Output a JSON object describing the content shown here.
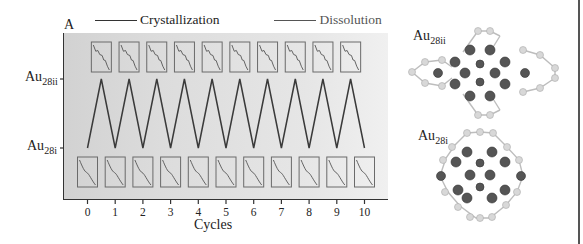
{
  "figure": {
    "panel_label": "A",
    "legend": [
      {
        "label": "Crystallization",
        "color": "#333333"
      },
      {
        "label": "Dissolution",
        "color": "#555555"
      }
    ],
    "y_labels": {
      "top": {
        "base": "Au",
        "sub": "28ii"
      },
      "bottom": {
        "base": "Au",
        "sub": "28i"
      }
    },
    "x_axis_title": "Cycles",
    "x_ticks": [
      "0",
      "1",
      "2",
      "3",
      "4",
      "5",
      "6",
      "7",
      "8",
      "9",
      "10"
    ],
    "structures": [
      {
        "base": "Au",
        "sub": "28ii"
      },
      {
        "base": "Au",
        "sub": "28i"
      }
    ]
  },
  "chart_data": {
    "type": "line",
    "title": "",
    "xlabel": "Cycles",
    "ylabel": "",
    "x": [
      0,
      0.5,
      1,
      1.5,
      2,
      2.5,
      3,
      3.5,
      4,
      4.5,
      5,
      5.5,
      6,
      6.5,
      7,
      7.5,
      8,
      8.5,
      9,
      9.5,
      10
    ],
    "series": [
      {
        "name": "Structure state (Au28i=0, Au28ii=1)",
        "values": [
          0,
          1,
          0,
          1,
          0,
          1,
          0,
          1,
          0,
          1,
          0,
          1,
          0,
          1,
          0,
          1,
          0,
          1,
          0,
          1,
          0
        ]
      }
    ],
    "categories_y": [
      "Au28i",
      "Au28ii"
    ],
    "xlim": [
      0,
      10
    ],
    "ylim": [
      0,
      1
    ],
    "grid": false,
    "legend": [
      "Crystallization",
      "Dissolution"
    ],
    "legend_position": "top",
    "annotations": [
      "A",
      "UV-vis absorption spectra insets for Au28ii (top row, 10 insets) and Au28i (bottom row, 11 insets)"
    ]
  }
}
